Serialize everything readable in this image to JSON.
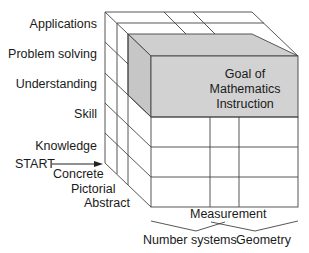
{
  "goal_block": {
    "line1": "Goal of",
    "line2": "Mathematics",
    "line3": "Instruction",
    "fill_color": "#cfcfcf"
  },
  "vertical_axis": {
    "levels": [
      "Applications",
      "Problem solving",
      "Understanding",
      "Skill",
      "Knowledge"
    ]
  },
  "start_marker": {
    "label": "START"
  },
  "depth_axis": {
    "levels": [
      "Concrete",
      "Pictorial",
      "Abstract"
    ]
  },
  "horizontal_axis": {
    "levels": [
      "Number systems",
      "Measurement",
      "Geometry"
    ]
  },
  "colors": {
    "line": "#333333",
    "shade": "#cfcfcf",
    "shade_dark": "#b9b9b9",
    "background": "#ffffff"
  }
}
